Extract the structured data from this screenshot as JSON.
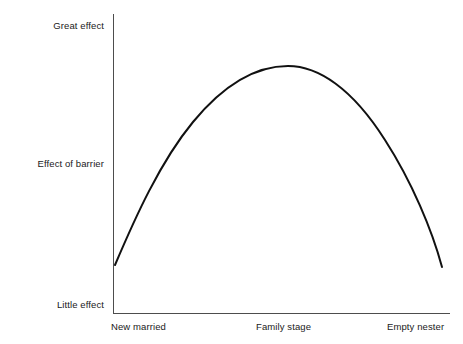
{
  "chart_data": {
    "type": "line",
    "title": "",
    "subtitle": "",
    "xlabel": "Family stage",
    "ylabel": "Effect of barrier",
    "grid": false,
    "legend": false,
    "legend_position": "none",
    "axis_color": "#4d4d4d",
    "curve_color": "#111111",
    "background": "#ffffff",
    "x_tick_labels": [
      "New married",
      "Family stage",
      "Empty nester"
    ],
    "y_tick_labels": [
      "Little effect",
      "Effect of barrier",
      "Great effect"
    ],
    "xlim": [
      0,
      1
    ],
    "ylim": [
      0,
      1
    ],
    "annotations": [],
    "series": [
      {
        "name": "Effect of barrier",
        "x": [
          0.0,
          0.05,
          0.1,
          0.15,
          0.2,
          0.25,
          0.3,
          0.35,
          0.4,
          0.45,
          0.5,
          0.55,
          0.6,
          0.65,
          0.7,
          0.75,
          0.8,
          0.85,
          0.9,
          0.95,
          1.0
        ],
        "y": [
          0.16,
          0.26,
          0.36,
          0.45,
          0.53,
          0.6,
          0.67,
          0.73,
          0.78,
          0.81,
          0.83,
          0.83,
          0.82,
          0.79,
          0.75,
          0.69,
          0.62,
          0.53,
          0.43,
          0.31,
          0.15
        ]
      }
    ]
  },
  "axes": {
    "y_ticks": [
      {
        "label": "Great effect"
      },
      {
        "label": "Effect of barrier"
      },
      {
        "label": "Little effect"
      }
    ],
    "x_ticks": [
      {
        "label": "New married"
      },
      {
        "label": "Family stage"
      },
      {
        "label": "Empty nester"
      }
    ]
  },
  "curve": {
    "path": "M 115 265 C 135 218 160 162 193 122 C 226 82 258 66 288 66 C 318 66 352 88 385 140 C 412 182 432 230 442 267"
  }
}
